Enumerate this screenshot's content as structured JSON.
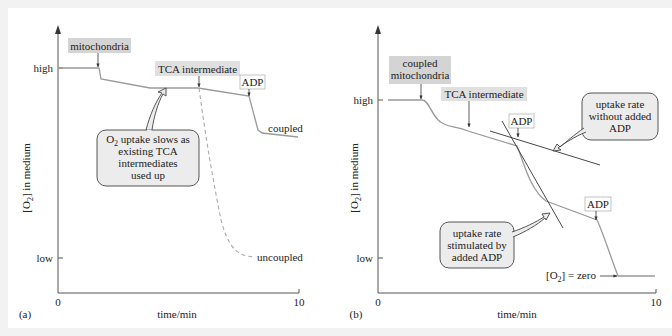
{
  "panels": [
    {
      "id": "a",
      "panel_label": "(a)",
      "y_axis_label": "[O2] in medium",
      "y_axis_label_main": "[O",
      "y_axis_label_sub": "2",
      "y_axis_label_rest": "] in medium",
      "y_ticks": {
        "high": "high",
        "low": "low"
      },
      "x_ticks": {
        "start": "0",
        "end": "10"
      },
      "x_axis_label": "time/min",
      "annotations": {
        "mitochondria": "mitochondria",
        "tca": "TCA intermediate",
        "adp": "ADP",
        "coupled": "coupled",
        "uncoupled": "uncoupled"
      },
      "callout": {
        "line1_main": "O",
        "line1_sub": "2",
        "line1_rest": " uptake slows as",
        "line2": "existing TCA",
        "line3": "intermediates",
        "line4": "used up"
      }
    },
    {
      "id": "b",
      "panel_label": "(b)",
      "y_axis_label": "[O2] in medium",
      "y_axis_label_main": "[O",
      "y_axis_label_sub": "2",
      "y_axis_label_rest": "] in medium",
      "y_ticks": {
        "high": "high",
        "low": "low"
      },
      "x_ticks": {
        "start": "0",
        "end": "10"
      },
      "x_axis_label": "time/min",
      "annotations": {
        "coupled_line1": "coupled",
        "coupled_line2": "mitochondria",
        "tca": "TCA intermediate",
        "adp1": "ADP",
        "adp2": "ADP",
        "zero_main": "[O",
        "zero_sub": "2",
        "zero_rest": "] = zero"
      },
      "callout_top": {
        "line1": "uptake rate",
        "line2": "without added",
        "line3": "ADP"
      },
      "callout_bottom": {
        "line1": "uptake rate",
        "line2": "stimulated by",
        "line3": "added ADP"
      }
    }
  ],
  "colors": {
    "curve": "#9a9a9a",
    "axis": "#555555",
    "label_fill": "#d4d4d4",
    "callout_fill": "#ececec",
    "callout_stroke": "#444444",
    "tangent": "#333333"
  }
}
